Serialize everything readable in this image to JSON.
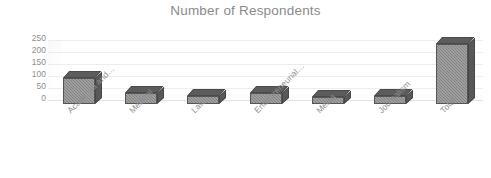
{
  "chart_data": {
    "type": "bar",
    "title": "Number of Respondents",
    "subtitle": "",
    "xlabel": "",
    "ylabel": "",
    "categories": [
      "Academia and…",
      "Medical",
      "Law",
      "Entrepreneurial…",
      "Media",
      "Journalism",
      "Total"
    ],
    "values": [
      110,
      45,
      35,
      45,
      30,
      35,
      250
    ],
    "ylim": [
      0,
      250
    ],
    "yticks": [
      250,
      200,
      150,
      100,
      50,
      0
    ],
    "ytick_labels": [
      "250",
      "200",
      "150",
      "100",
      "50",
      "0"
    ],
    "grid": true,
    "legend": false,
    "legend_position": "none",
    "series": [
      {
        "name": "Number of Respondents",
        "values": [
          110,
          45,
          35,
          45,
          30,
          35,
          250
        ]
      }
    ],
    "style": "3d-clustered-column",
    "colors": {
      "bar_front": "#838383",
      "bar_top": "#5c5c5c",
      "bar_side": "#585858",
      "bar_outline": "#555555",
      "gridline": "#ededed",
      "text": "#8f8f8f",
      "title_text": "#8a8a8a",
      "background": "#ffffff"
    }
  }
}
